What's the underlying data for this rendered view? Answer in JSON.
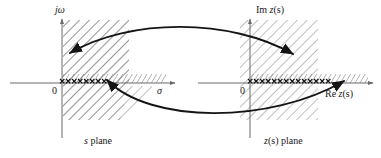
{
  "figure": {
    "kind": "complex-plane-mapping-diagram",
    "width": 381,
    "height": 158,
    "background_color": "#ffffff",
    "ink_color": "#1a1a1a",
    "hatch_color": "#6b6b6b",
    "axis_color": "#6b6b6b"
  },
  "left_plane": {
    "name": "s-plane",
    "caption": "s plane",
    "caption_italic_part": "s",
    "caption_rest": " plane",
    "vertical_axis_label": "jω",
    "horizontal_axis_label": "σ",
    "origin_label": "0",
    "origin_px": {
      "x": 62,
      "y": 83
    },
    "hatched_region_description": "vertical strip left of the imaginary axis and extending right, plus hatched strip along the positive real axis",
    "branch_cut_marks": "××××××××",
    "branch_point_px": {
      "x": 106,
      "y": 81
    }
  },
  "right_plane": {
    "name": "z(s)-plane",
    "caption": "z(s) plane",
    "caption_italic_part": "z",
    "caption_rest": "(s) plane",
    "vertical_axis_label": "Im z(s)",
    "vertical_axis_label_plain": "Im ",
    "vertical_axis_label_italic": "z",
    "vertical_axis_label_tail": "(s)",
    "horizontal_axis_label": "Re z(s)",
    "horizontal_axis_label_plain": "Re ",
    "horizontal_axis_label_italic": "z",
    "horizontal_axis_label_tail": "(s)",
    "origin_label": "0",
    "origin_px": {
      "x": 250,
      "y": 83
    },
    "hatched_region_description": "vertical strip around the imaginary axis plus hatched strip along the positive real axis",
    "branch_cut_marks": "××××××××××",
    "branch_point_px": {
      "x": 345,
      "y": 81
    }
  },
  "mapping_arrows": [
    {
      "id": "upper-mapping-arrow",
      "direction": "left-plane-to-right-plane",
      "label": "",
      "head_positions": [
        "left",
        "right"
      ]
    },
    {
      "id": "lower-mapping-arrow",
      "direction": "right-plane-to-left-plane",
      "label": "",
      "head_positions": [
        "left",
        "right"
      ]
    }
  ]
}
